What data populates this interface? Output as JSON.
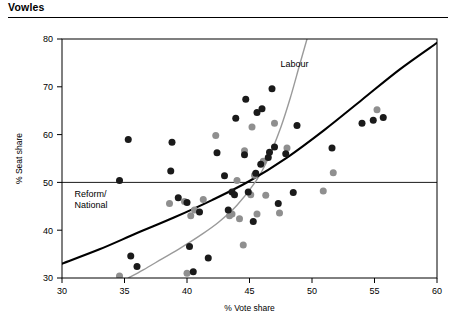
{
  "header": {
    "title": "Vowles"
  },
  "chart_data": {
    "type": "scatter",
    "title": "",
    "xlabel": "% Vote share",
    "ylabel": "% Seat share",
    "xlim": [
      30,
      60
    ],
    "ylim": [
      30,
      80
    ],
    "xticks": [
      30,
      35,
      40,
      45,
      50,
      55,
      60
    ],
    "yticks": [
      30,
      40,
      50,
      60,
      70,
      80
    ],
    "grid": false,
    "legend_position": "inline-annotations",
    "reference_lines": [
      {
        "name": "fifty-percent-seat-share",
        "orientation": "horizontal",
        "value": 50,
        "color": "#000000"
      }
    ],
    "annotations": [
      {
        "name": "labour-label",
        "text": "Labour",
        "x": 48.6,
        "y": 74.2
      },
      {
        "name": "reform-national-label",
        "text": "Reform/\nNational",
        "x": 31.0,
        "y": 47.0
      }
    ],
    "series": [
      {
        "name": "Reform/National",
        "label": "Reform/\nNational",
        "marker": "circle",
        "color": "#1a1a1a",
        "points": [
          [
            34.6,
            50.4
          ],
          [
            35.3,
            59.0
          ],
          [
            35.5,
            34.6
          ],
          [
            36.0,
            32.4
          ],
          [
            38.7,
            52.4
          ],
          [
            38.8,
            58.4
          ],
          [
            39.3,
            46.8
          ],
          [
            40.0,
            45.8
          ],
          [
            40.2,
            36.6
          ],
          [
            40.5,
            31.3
          ],
          [
            41.0,
            43.8
          ],
          [
            41.7,
            34.2
          ],
          [
            42.4,
            56.2
          ],
          [
            43.0,
            51.4
          ],
          [
            43.3,
            44.2
          ],
          [
            43.6,
            48.0
          ],
          [
            43.8,
            47.4
          ],
          [
            43.9,
            63.4
          ],
          [
            44.6,
            55.8
          ],
          [
            44.7,
            67.4
          ],
          [
            44.9,
            48.0
          ],
          [
            45.3,
            41.8
          ],
          [
            45.5,
            51.9
          ],
          [
            45.6,
            64.6
          ],
          [
            45.9,
            53.8
          ],
          [
            46.0,
            65.4
          ],
          [
            46.5,
            55.2
          ],
          [
            46.6,
            56.3
          ],
          [
            46.8,
            69.6
          ],
          [
            47.0,
            57.4
          ],
          [
            47.3,
            45.6
          ],
          [
            47.9,
            56.0
          ],
          [
            48.5,
            47.9
          ],
          [
            48.8,
            61.9
          ],
          [
            51.6,
            57.2
          ],
          [
            54.0,
            62.4
          ],
          [
            54.9,
            63.0
          ],
          [
            55.7,
            63.6
          ]
        ]
      },
      {
        "name": "Labour",
        "label": "Labour",
        "marker": "circle",
        "color": "#8f8f8f",
        "points": [
          [
            34.6,
            30.4
          ],
          [
            38.6,
            45.6
          ],
          [
            39.8,
            46.0
          ],
          [
            40.0,
            31.0
          ],
          [
            40.3,
            43.0
          ],
          [
            40.6,
            44.2
          ],
          [
            41.3,
            46.4
          ],
          [
            42.3,
            59.8
          ],
          [
            43.4,
            43.0
          ],
          [
            43.6,
            43.4
          ],
          [
            44.0,
            50.4
          ],
          [
            44.2,
            42.4
          ],
          [
            44.5,
            36.9
          ],
          [
            44.6,
            56.6
          ],
          [
            45.1,
            47.4
          ],
          [
            45.2,
            61.6
          ],
          [
            45.4,
            51.5
          ],
          [
            45.6,
            43.4
          ],
          [
            46.1,
            54.4
          ],
          [
            46.3,
            47.3
          ],
          [
            47.0,
            62.4
          ],
          [
            47.4,
            43.6
          ],
          [
            48.0,
            57.2
          ],
          [
            50.9,
            48.2
          ],
          [
            51.7,
            52.0
          ],
          [
            55.2,
            65.2
          ]
        ]
      }
    ],
    "curves": [
      {
        "name": "Reform/National",
        "label": "Reform/\nNational",
        "color": "#000000",
        "width": 2.1,
        "points": [
          [
            30.0,
            33.0
          ],
          [
            33.0,
            36.0
          ],
          [
            36.0,
            39.4
          ],
          [
            39.0,
            42.7
          ],
          [
            42.0,
            46.3
          ],
          [
            45.0,
            50.3
          ],
          [
            48.0,
            55.2
          ],
          [
            51.0,
            61.0
          ],
          [
            54.0,
            67.3
          ],
          [
            57.0,
            73.6
          ],
          [
            60.0,
            79.2
          ]
        ]
      },
      {
        "name": "Labour",
        "label": "Labour",
        "color": "#9a9a9a",
        "width": 1.4,
        "points": [
          [
            35.3,
            30.0
          ],
          [
            36.5,
            31.7
          ],
          [
            38.0,
            34.0
          ],
          [
            39.5,
            36.3
          ],
          [
            41.0,
            38.8
          ],
          [
            42.5,
            41.6
          ],
          [
            44.0,
            45.2
          ],
          [
            45.5,
            50.2
          ],
          [
            46.5,
            55.0
          ],
          [
            47.5,
            61.5
          ],
          [
            48.3,
            68.0
          ],
          [
            49.0,
            74.5
          ],
          [
            49.6,
            80.0
          ]
        ]
      }
    ]
  }
}
